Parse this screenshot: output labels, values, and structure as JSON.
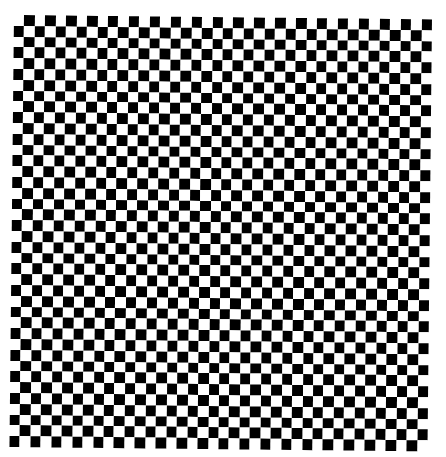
{
  "image": {
    "type": "checkerboard",
    "rows": 40,
    "cols": 40,
    "top_left_color": "white",
    "colors": {
      "dark": "#000000",
      "light": "#ffffff",
      "background": "#ffffff"
    }
  }
}
